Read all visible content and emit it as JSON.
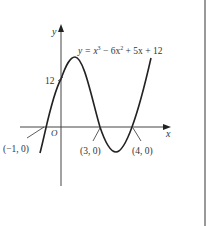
{
  "figure": {
    "equation": {
      "prefix": "y = x",
      "sup1": "3",
      "mid": " − 6x",
      "sup2": "2",
      "suffix": " + 5x + 12"
    },
    "axes": {
      "x_label": "x",
      "y_label": "y",
      "origin_label": "O"
    },
    "y_intercept_label": "12",
    "roots": [
      {
        "label": "(−1, 0)",
        "x": -1
      },
      {
        "label": "(3, 0)",
        "x": 3
      },
      {
        "label": "(4, 0)",
        "x": 4
      }
    ]
  }
}
